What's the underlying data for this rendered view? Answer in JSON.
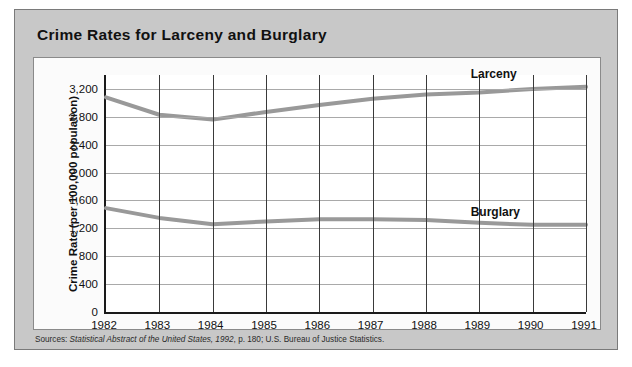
{
  "figure": {
    "title": "Crime Rates for Larceny and Burglary",
    "source_prefix": "Sources:",
    "source_italic": "Statistical Abstract of the United States, 1992",
    "source_rest": ", p. 180; U.S. Bureau of Justice Statistics.",
    "colors": {
      "frame_background": "#c8c8c8",
      "panel_background": "#fbfbfb",
      "plot_background": "#ffffff",
      "axis": "#1a1a1a",
      "vertical_gridline": "#3a3a3a",
      "horizontal_gridline": "#a9a9a9",
      "series_line": "#999999",
      "text": "#111111"
    }
  },
  "chart_data": {
    "type": "line",
    "title": "Crime Rates for Larceny and Burglary",
    "xlabel": "",
    "ylabel": "Crime Rate (per 100,000 population)",
    "x": [
      1982,
      1983,
      1984,
      1985,
      1986,
      1987,
      1988,
      1989,
      1990,
      1991
    ],
    "categories": [
      "1982",
      "1983",
      "1984",
      "1985",
      "1986",
      "1987",
      "1988",
      "1989",
      "1990",
      "1991"
    ],
    "ylim": [
      0,
      3400
    ],
    "yticks": [
      0,
      400,
      800,
      1200,
      1600,
      2000,
      2400,
      2800,
      3200
    ],
    "ytick_labels": [
      "0",
      "400",
      "800",
      "1,200",
      "1,600",
      "2,000",
      "2,400",
      "2,800",
      "3,200"
    ],
    "grid": "both",
    "legend": "inline-labels",
    "series": [
      {
        "name": "Larceny",
        "label": "Larceny",
        "values": [
          3080,
          2830,
          2760,
          2870,
          2970,
          3060,
          3120,
          3150,
          3200,
          3230
        ]
      },
      {
        "name": "Burglary",
        "label": "Burglary",
        "values": [
          1490,
          1350,
          1260,
          1300,
          1330,
          1330,
          1320,
          1280,
          1250,
          1250
        ]
      }
    ]
  }
}
